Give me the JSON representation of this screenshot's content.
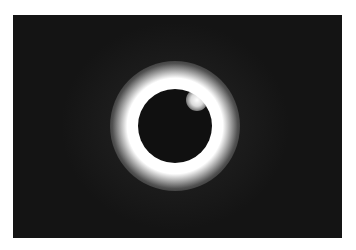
{
  "image": {
    "subject": "Total solar eclipse with diamond ring effect",
    "description": "Dark moon disk centered in a bright white corona against a black sky, with a bright diamond-ring flare at the upper right of the disk",
    "colors": {
      "sky": "#141414",
      "moon": "#101010",
      "corona": "#ffffff",
      "border": "#ffffff"
    }
  }
}
